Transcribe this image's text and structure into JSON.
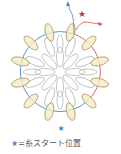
{
  "diagram": {
    "colors": {
      "blue_thread": "#4a86c8",
      "red_thread": "#d9534f",
      "outer_petal_fill": "#f6ebc6",
      "outer_petal_stroke": "#a89a68",
      "inner_petal_stroke": "#b0b0b0"
    },
    "outer_petal_count": 12,
    "inner_petal_count": 16,
    "markers": [
      {
        "type": "star",
        "color": "blue",
        "position": "bottom"
      },
      {
        "type": "star",
        "color": "red",
        "position": "top-right"
      },
      {
        "type": "arrow",
        "color": "blue",
        "direction": "up"
      },
      {
        "type": "arrow",
        "color": "red",
        "direction": "right"
      }
    ]
  },
  "legend": {
    "symbol": "★",
    "text": "=糸スタート位置"
  }
}
